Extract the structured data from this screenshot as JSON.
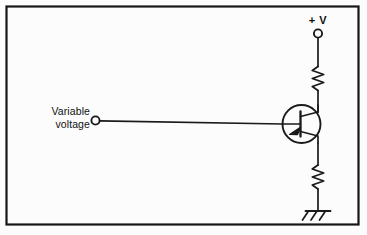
{
  "diagram": {
    "type": "schematic",
    "background_color": "#fcfcfc",
    "line_color": "#1a1a1a",
    "border": {
      "present": true,
      "shape": "rectangle",
      "stroke_width": 2
    },
    "labels": {
      "input_label": "Variable\nvoltage",
      "input_label_line1": "Variable",
      "input_label_line2": "voltage",
      "supply_label": "+ V"
    },
    "components": [
      {
        "name": "input-terminal",
        "type": "terminal",
        "style": "open-circle",
        "label": "Variable voltage"
      },
      {
        "name": "supply-terminal",
        "type": "terminal",
        "style": "open-circle",
        "label": "+ V"
      },
      {
        "name": "collector-resistor",
        "type": "resistor",
        "style": "zigzag",
        "orientation": "vertical",
        "position": "upper"
      },
      {
        "name": "transistor",
        "type": "bipolar-junction-transistor",
        "style": "circle-enclosed",
        "terminals": [
          "base",
          "collector",
          "emitter"
        ],
        "arrow_on": "emitter",
        "arrow_direction": "inward-down-left"
      },
      {
        "name": "emitter-resistor",
        "type": "resistor",
        "style": "zigzag",
        "orientation": "vertical",
        "position": "lower"
      },
      {
        "name": "ground",
        "type": "chassis-ground",
        "hatch_count": 3
      }
    ],
    "wires": [
      {
        "name": "base-wire",
        "from": "input-terminal",
        "to": "transistor-base"
      },
      {
        "name": "supply-wire",
        "from": "supply-terminal",
        "to": "collector-resistor"
      },
      {
        "name": "collector-wire",
        "from": "collector-resistor",
        "to": "transistor-collector"
      },
      {
        "name": "emitter-wire",
        "from": "transistor-emitter",
        "to": "emitter-resistor"
      },
      {
        "name": "ground-wire",
        "from": "emitter-resistor",
        "to": "ground"
      }
    ]
  }
}
